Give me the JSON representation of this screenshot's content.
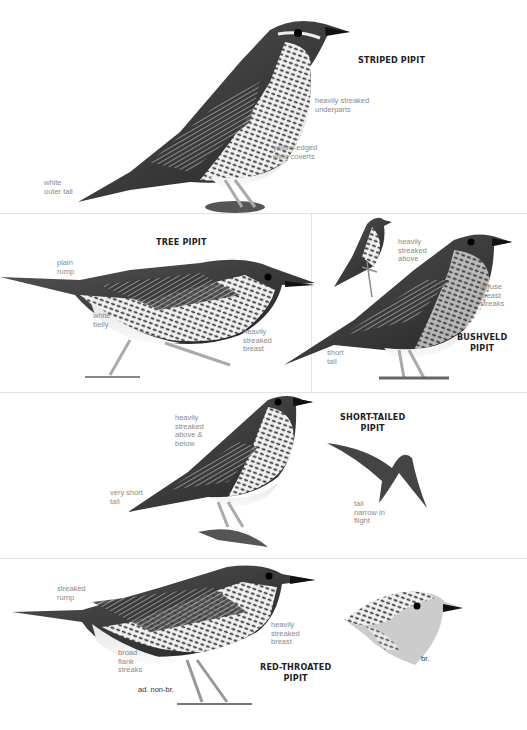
{
  "plate": {
    "background": "#ffffff",
    "divider_color": "#e2e2e2",
    "title_color": "#222222",
    "label_color": "#8a8a8a"
  },
  "species": [
    {
      "name": "STRIPED PIPIT",
      "labels": [
        "heavily streaked\nunderparts",
        "yellow-edged\nwing coverts",
        "white\nouter tail"
      ]
    },
    {
      "name": "TREE PIPIT",
      "labels": [
        "plain\nrump",
        "white\nbelly",
        "heavily\nstreaked\nbreast"
      ]
    },
    {
      "name": "BUSHVELD\nPIPIT",
      "labels": [
        "heavily\nstreaked\nabove",
        "diffuse\nbreast\nstreaks",
        "short\ntail"
      ]
    },
    {
      "name": "SHORT-TAILED\nPIPIT",
      "labels": [
        "heavily\nstreaked\nabove &\nbelow",
        "very short\ntail",
        "tail\nnarrow in\nflight"
      ]
    },
    {
      "name": "RED-THROATED\nPIPIT",
      "labels": [
        "streaked\nrump",
        "heavily\nstreaked\nbreast",
        "broad\nflank\nstreaks"
      ],
      "age_labels": [
        "ad. non-br.",
        "br."
      ]
    }
  ],
  "icons": {
    "striped": "bird-striped-pipit-illustration",
    "tree": "bird-tree-pipit-illustration",
    "bushveld": "bird-bushveld-pipit-illustration",
    "bushveld_small": "bird-bushveld-pipit-perched-illustration",
    "shorttailed": "bird-short-tailed-pipit-illustration",
    "shorttailed_flight": "bird-short-tailed-pipit-flight-illustration",
    "redthroated": "bird-red-throated-pipit-illustration",
    "redthroated_head": "bird-red-throated-pipit-head-illustration"
  }
}
